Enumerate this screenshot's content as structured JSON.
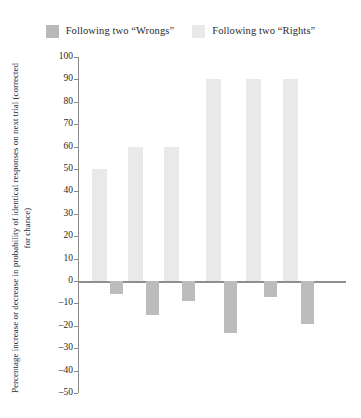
{
  "legend": {
    "entries": [
      {
        "label": "Following two “Wrongs”",
        "color": "#b9b9b9",
        "swatch_name": "legend-swatch-wrongs"
      },
      {
        "label": "Following two “Rights”",
        "color": "#e9e9e9",
        "swatch_name": "legend-swatch-rights"
      }
    ]
  },
  "axis": {
    "ylabel": "Percentage increase or decrease in probability of identical responses on next trial (corrected for chance)",
    "ticks": [
      100,
      90,
      80,
      70,
      60,
      50,
      40,
      30,
      20,
      10,
      0,
      -10,
      -20,
      -30,
      -40,
      -50
    ],
    "tick_labels": [
      "100",
      "90",
      "80",
      "70",
      "60",
      "50",
      "40",
      "30",
      "20",
      "10",
      "0",
      "–10",
      "–20",
      "–30",
      "–40",
      "–50"
    ]
  },
  "colors": {
    "rights_bar": "#e9e9e9",
    "wrongs_bar": "#bcbcbc",
    "axis_line": "#8a8a8a",
    "baseline": "#8f8f8f",
    "text": "#2a2a2a"
  },
  "chart_data": {
    "type": "bar",
    "title": "",
    "xlabel": "",
    "ylabel": "Percentage increase or decrease in probability of identical responses on next trial (corrected for chance)",
    "ylim": [
      -50,
      100
    ],
    "ytick_step": 10,
    "grid": false,
    "legend_position": "top-center",
    "categories": [
      "1",
      "2",
      "3",
      "4",
      "5",
      "6"
    ],
    "series": [
      {
        "name": "Following two “Rights”",
        "color": "#e9e9e9",
        "values": [
          50,
          60,
          60,
          90,
          90,
          90
        ]
      },
      {
        "name": "Following two “Wrongs”",
        "color": "#bcbcbc",
        "values": [
          -6,
          -15,
          -9,
          -23,
          -7,
          -19
        ]
      }
    ]
  },
  "layout": {
    "group_left": [
      14,
      50,
      86,
      128,
      168,
      205
    ],
    "rights_bar_width": 15,
    "wrongs_bar_width": 13,
    "wrongs_offset": 18
  }
}
